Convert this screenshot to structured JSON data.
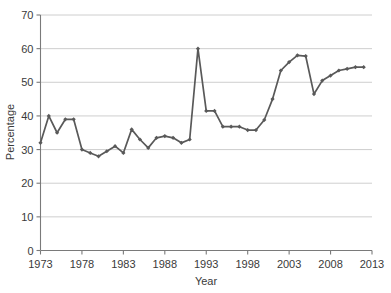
{
  "chart_data": {
    "type": "line",
    "title": "",
    "xlabel": "Year",
    "ylabel": "Percentage",
    "xlim": [
      1973,
      2013
    ],
    "ylim": [
      0,
      70
    ],
    "grid": true,
    "legend": false,
    "legend_position": "none",
    "series_color": "#595959",
    "gridline_color": "#c8c8c8",
    "axis_color": "#7a7a7a",
    "marker": "diamond",
    "x_ticks": [
      1973,
      1978,
      1983,
      1988,
      1993,
      1998,
      2003,
      2008,
      2013
    ],
    "x_tick_labels": [
      "1973",
      "1978",
      "1983",
      "1988",
      "1993",
      "1998",
      "2003",
      "2008",
      "2013"
    ],
    "y_ticks": [
      0,
      10,
      20,
      30,
      40,
      50,
      60,
      70
    ],
    "y_tick_labels": [
      "0",
      "10",
      "20",
      "30",
      "40",
      "50",
      "60",
      "70"
    ],
    "x": [
      1973,
      1974,
      1975,
      1976,
      1977,
      1978,
      1979,
      1980,
      1981,
      1982,
      1983,
      1984,
      1985,
      1986,
      1987,
      1988,
      1989,
      1990,
      1991,
      1992,
      1993,
      1994,
      1995,
      1996,
      1997,
      1998,
      1999,
      2000,
      2001,
      2002,
      2003,
      2004,
      2005,
      2006,
      2007,
      2008,
      2009,
      2010,
      2011,
      2012
    ],
    "values": [
      32.0,
      40.0,
      35.0,
      39.0,
      39.0,
      30.0,
      29.0,
      28.0,
      29.5,
      31.0,
      29.0,
      36.0,
      33.0,
      30.5,
      33.5,
      34.0,
      33.5,
      32.0,
      33.0,
      60.0,
      41.5,
      41.5,
      36.8,
      36.8,
      36.8,
      35.8,
      35.8,
      38.8,
      45.0,
      53.5,
      56.0,
      58.0,
      57.8,
      46.5,
      50.5,
      52.0,
      53.5,
      54.0,
      54.5,
      54.5
    ],
    "series": [
      {
        "name": "Percentage",
        "values": [
          32.0,
          40.0,
          35.0,
          39.0,
          39.0,
          30.0,
          29.0,
          28.0,
          29.5,
          31.0,
          29.0,
          36.0,
          33.0,
          30.5,
          33.5,
          34.0,
          33.5,
          32.0,
          33.0,
          60.0,
          41.5,
          41.5,
          36.8,
          36.8,
          36.8,
          35.8,
          35.8,
          38.8,
          45.0,
          53.5,
          56.0,
          58.0,
          57.8,
          46.5,
          50.5,
          52.0,
          53.5,
          54.0,
          54.5,
          54.5
        ]
      }
    ]
  }
}
